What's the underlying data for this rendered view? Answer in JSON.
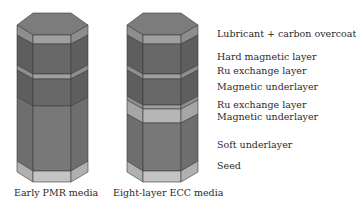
{
  "colors": {
    "top_face": "#7a7a7a",
    "dark_layer": "#6a6a6a",
    "mid_layer": "#8a8a8a",
    "light_layer": "#b4b4b4",
    "seed_layer": "#c2c2c2",
    "edge": "#3a3a3a"
  },
  "stacks": [
    {
      "caption": "Early PMR media",
      "layers": [
        {
          "name": "overcoat",
          "shade": "mid"
        },
        {
          "name": "magnetic layer",
          "shade": "dark"
        },
        {
          "name": "exchange layer",
          "shade": "mid"
        },
        {
          "name": "magnetic layer",
          "shade": "dark"
        },
        {
          "name": "soft underlayer",
          "shade": "dark"
        },
        {
          "name": "seed",
          "shade": "light"
        }
      ]
    },
    {
      "caption": "Eight-layer ECC media",
      "layers": [
        {
          "name": "Lubricant + carbon overcoat",
          "shade": "mid"
        },
        {
          "name": "Hard magnetic layer",
          "shade": "dark"
        },
        {
          "name": "Ru exchange layer",
          "shade": "mid"
        },
        {
          "name": "Magnetic underlayer",
          "shade": "dark"
        },
        {
          "name": "Ru exchange layer",
          "shade": "mid"
        },
        {
          "name": "Magnetic underlayer",
          "shade": "light"
        },
        {
          "name": "Soft underlayer",
          "shade": "dark"
        },
        {
          "name": "Seed",
          "shade": "light"
        }
      ]
    }
  ],
  "labels": [
    "Lubricant + carbon overcoat",
    "Hard magnetic layer",
    "Ru exchange layer",
    "Magnetic underlayer",
    "Ru exchange layer",
    "Magnetic underlayer",
    "Soft underlayer",
    "Seed"
  ]
}
